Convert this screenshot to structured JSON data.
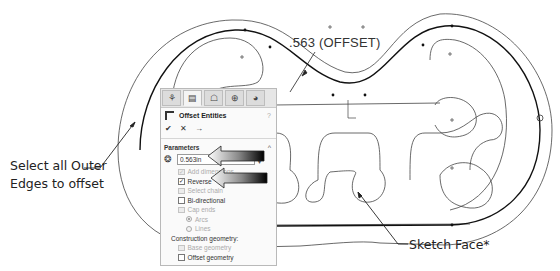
{
  "drawing": {
    "dimension_label": ".563 (OFFSET)",
    "line_color": "#333333",
    "highlight_color": "#111111"
  },
  "callouts": {
    "select_edges": {
      "line1": "Select all Outer",
      "line2": "Edges to offset"
    },
    "sketch_face": "Sketch Face*"
  },
  "property_manager": {
    "tabs": [
      {
        "name": "feature-manager",
        "glyph": "⚘"
      },
      {
        "name": "property-manager",
        "glyph": "▤"
      },
      {
        "name": "configuration-manager",
        "glyph": "☖"
      },
      {
        "name": "dimxpert-manager",
        "glyph": "⊕"
      },
      {
        "name": "display-manager",
        "glyph": "◕"
      }
    ],
    "title": "Offset Entities",
    "help_glyph": "?",
    "actions": {
      "ok": "✔",
      "cancel": "✕",
      "pin": "→"
    },
    "parameters": {
      "heading": "Parameters",
      "collapse_glyph": "^",
      "distance_value": "0.563in",
      "spin_up": "▴",
      "spin_down": "▾",
      "options": [
        {
          "label": "Add dimensions",
          "checked": true,
          "enabled": false
        },
        {
          "label": "Reverse",
          "checked": true,
          "enabled": true
        },
        {
          "label": "Select chain",
          "checked": false,
          "enabled": false
        },
        {
          "label": "Bi-directional",
          "checked": false,
          "enabled": true
        },
        {
          "label": "Cap ends",
          "checked": false,
          "enabled": false
        }
      ],
      "cap_types": [
        {
          "label": "Arcs",
          "selected": true
        },
        {
          "label": "Lines",
          "selected": false
        }
      ],
      "construction_heading": "Construction geometry:",
      "construction": [
        {
          "label": "Base geometry",
          "checked": false,
          "enabled": false
        },
        {
          "label": "Offset geometry",
          "checked": false,
          "enabled": true
        }
      ]
    }
  }
}
